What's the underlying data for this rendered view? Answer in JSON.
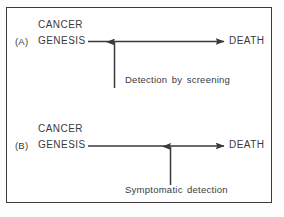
{
  "figure": {
    "background_color": "#ffffff",
    "ink_color": "#3a3a3e",
    "border_color": "#3a3a3e"
  },
  "panels": [
    {
      "letter": "(A)",
      "start_line1": "CANCER",
      "start_line2": "GENESIS",
      "end_label": "DEATH",
      "annotation": "Detection by screening",
      "arrow_direction": "left-to-right",
      "marker_direction": "upward"
    },
    {
      "letter": "(B)",
      "start_line1": "CANCER",
      "start_line2": "GENESIS",
      "end_label": "DEATH",
      "annotation": "Symptomatic detection",
      "arrow_direction": "left-to-right",
      "marker_direction": "upward"
    }
  ]
}
